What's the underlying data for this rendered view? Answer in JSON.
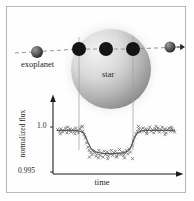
{
  "figure": {
    "title_visible": false,
    "background_color": "#ffffff",
    "border_color": "#b9b9b9"
  },
  "diagram": {
    "star": {
      "label": "star",
      "center_x": 104,
      "center_y": 62,
      "radius": 40,
      "fill_light": "#eeeeee",
      "fill_dark": "#8d8d8d"
    },
    "orbit_path": {
      "label": "orbit-track",
      "y": 42,
      "x_start": 8,
      "x_end": 176,
      "stroke": "#8a8a8a",
      "dash": "4,3"
    },
    "planet_label": "exoplanet",
    "planets": [
      {
        "name": "planet-pre-transit",
        "cx": 30,
        "cy": 45,
        "r": 6.0,
        "shaded": true
      },
      {
        "name": "planet-ingress",
        "cx": 72,
        "cy": 42,
        "r": 7.0,
        "shaded": false
      },
      {
        "name": "planet-mid-transit",
        "cx": 99,
        "cy": 42,
        "r": 7.0,
        "shaded": false
      },
      {
        "name": "planet-egress",
        "cx": 126,
        "cy": 42,
        "r": 7.0,
        "shaded": false
      },
      {
        "name": "planet-post-transit",
        "cx": 163,
        "cy": 40,
        "r": 5.5,
        "shaded": true
      }
    ],
    "guide_lines": [
      {
        "name": "guide-line-ingress",
        "x": 72,
        "y_top": 30,
        "y_bottom": 143
      },
      {
        "name": "guide-line-egress",
        "x": 126,
        "y_top": 30,
        "y_bottom": 143
      }
    ],
    "direction_arrow": {
      "name": "motion-arrow",
      "x": 176,
      "y": 40
    }
  },
  "chart_data": {
    "type": "scatter",
    "title": "",
    "xlabel": "time",
    "ylabel": "normalized flux",
    "ytick_labels": [
      "1.0",
      "0.995"
    ],
    "ytick_values": [
      1.0,
      0.995
    ],
    "ylim": [
      0.995,
      1.0015
    ],
    "xlim": [
      0,
      1
    ],
    "grid": false,
    "legend": false,
    "axis_arrows": true,
    "marker": "x",
    "marker_color": "#6e6e6e",
    "model_curve_color": "#5a5a5a",
    "transit_start_x": 0.235,
    "transit_end_x": 0.655,
    "transit_depth": 0.0028,
    "baseline_flux": 1.0,
    "series": [
      {
        "name": "model-transit-curve",
        "x": [
          0.0,
          0.05,
          0.1,
          0.15,
          0.2,
          0.225,
          0.24,
          0.26,
          0.29,
          0.33,
          0.4,
          0.48,
          0.56,
          0.6,
          0.625,
          0.64,
          0.655,
          0.675,
          0.7,
          0.74,
          0.8,
          0.86,
          0.92,
          1.0
        ],
        "y": [
          1.0,
          1.0,
          1.0,
          1.0,
          0.9999,
          0.9997,
          0.9993,
          0.9986,
          0.9978,
          0.9974,
          0.9972,
          0.9972,
          0.9973,
          0.9975,
          0.9979,
          0.9985,
          0.9991,
          0.9996,
          0.9999,
          1.0,
          1.0,
          1.0,
          1.0,
          1.0
        ]
      },
      {
        "name": "measured-flux-points",
        "x": [
          0.005,
          0.02,
          0.033,
          0.047,
          0.06,
          0.072,
          0.085,
          0.097,
          0.108,
          0.12,
          0.133,
          0.145,
          0.158,
          0.17,
          0.182,
          0.195,
          0.207,
          0.218,
          0.23,
          0.24,
          0.25,
          0.262,
          0.273,
          0.285,
          0.296,
          0.308,
          0.32,
          0.331,
          0.343,
          0.355,
          0.366,
          0.378,
          0.39,
          0.401,
          0.413,
          0.425,
          0.436,
          0.448,
          0.46,
          0.471,
          0.483,
          0.495,
          0.506,
          0.518,
          0.53,
          0.541,
          0.553,
          0.565,
          0.576,
          0.588,
          0.6,
          0.611,
          0.623,
          0.635,
          0.646,
          0.658,
          0.67,
          0.681,
          0.693,
          0.705,
          0.716,
          0.728,
          0.74,
          0.751,
          0.763,
          0.775,
          0.786,
          0.798,
          0.81,
          0.821,
          0.833,
          0.845,
          0.856,
          0.868,
          0.88,
          0.891,
          0.903,
          0.915,
          0.926,
          0.938,
          0.95,
          0.961,
          0.973,
          0.985,
          0.996,
          0.028,
          0.09,
          0.15,
          0.275,
          0.352,
          0.43,
          0.505,
          0.572,
          0.64,
          0.69,
          0.76,
          0.84,
          0.915,
          0.97,
          0.215
        ],
        "y": [
          1.0001,
          0.9999,
          1.0002,
          0.9998,
          1.0,
          1.0003,
          0.9997,
          1.0,
          1.0002,
          0.9998,
          1.0001,
          0.9999,
          1.0003,
          1.0,
          0.9997,
          1.0002,
          1.0004,
          0.9999,
          0.9995,
          0.9991,
          0.9985,
          0.998,
          0.9976,
          0.9974,
          0.9971,
          0.9975,
          0.9973,
          0.9969,
          0.9972,
          0.9976,
          0.997,
          0.9973,
          0.9968,
          0.9975,
          0.9971,
          0.9974,
          0.9969,
          0.9972,
          0.9976,
          0.997,
          0.9973,
          0.9975,
          0.9969,
          0.9972,
          0.9977,
          0.9971,
          0.9974,
          0.997,
          0.9973,
          0.9976,
          0.9972,
          0.9978,
          0.9974,
          0.9982,
          0.9987,
          0.9992,
          0.9996,
          0.9999,
          1.0002,
          0.9998,
          1.0001,
          1.0003,
          0.9999,
          1.0002,
          0.9998,
          1.0001,
          1.0004,
          0.9999,
          1.0001,
          0.9997,
          1.0002,
          1.0,
          1.0003,
          0.9998,
          1.0001,
          1.0004,
          0.9999,
          1.0002,
          0.9997,
          1.0001,
          1.0003,
          0.9999,
          1.0002,
          1.0,
          0.9998,
          0.9996,
          1.0004,
          0.9996,
          0.9968,
          0.9967,
          0.9966,
          0.9968,
          0.9967,
          0.9966,
          1.0005,
          0.9996,
          1.0005,
          0.9995,
          1.0004,
          1.0005
        ]
      }
    ]
  }
}
